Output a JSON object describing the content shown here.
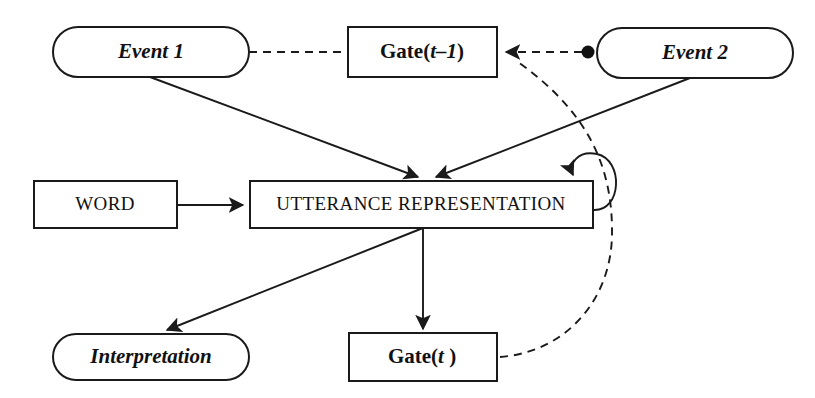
{
  "diagram": {
    "background_color": "#ffffff",
    "stroke_color": "#1a1a1a",
    "nodes": [
      {
        "id": "event1",
        "data_name": "node-event-1",
        "label": "Event 1",
        "shape": "rounded-rect",
        "style": "bold-italic",
        "x": 53,
        "y": 27,
        "w": 196,
        "h": 50
      },
      {
        "id": "gate_t_minus_1",
        "data_name": "node-gate-t-minus-1",
        "label": "Gate(t–1)",
        "label_bold_part": "Gate(",
        "label_italic_part": "t–1",
        "label_tail": ")",
        "shape": "rect",
        "style": "bold",
        "x": 348,
        "y": 27,
        "w": 149,
        "h": 50
      },
      {
        "id": "event2",
        "data_name": "node-event-2",
        "label": "Event 2",
        "shape": "rounded-rect",
        "style": "bold-italic",
        "x": 597,
        "y": 28,
        "w": 196,
        "h": 50
      },
      {
        "id": "word",
        "data_name": "node-word",
        "label": "WORD",
        "shape": "rect",
        "style": "plain-caps",
        "x": 34,
        "y": 181,
        "w": 143,
        "h": 47
      },
      {
        "id": "utterance",
        "data_name": "node-utterance-representation",
        "label": "UTTERANCE REPRESENTATION",
        "shape": "rect",
        "style": "plain-caps",
        "x": 250,
        "y": 181,
        "w": 343,
        "h": 47
      },
      {
        "id": "interpretation",
        "data_name": "node-interpretation",
        "label": "Interpretation",
        "shape": "rounded-rect",
        "style": "bold-italic",
        "x": 53,
        "y": 334,
        "w": 196,
        "h": 46
      },
      {
        "id": "gate_t",
        "data_name": "node-gate-t",
        "label": "Gate(t )",
        "label_bold_part": "Gate(",
        "label_italic_part": "t",
        "label_tail": " )",
        "shape": "rect",
        "style": "bold",
        "x": 349,
        "y": 333,
        "w": 148,
        "h": 48
      }
    ],
    "edges": [
      {
        "id": "e1",
        "data_name": "edge-event1-to-gate-t-minus-1",
        "from": "event1",
        "to": "gate_t_minus_1",
        "line": "dashed",
        "arrowhead": false
      },
      {
        "id": "e2",
        "data_name": "edge-event1-to-utterance",
        "from": "event1",
        "to": "utterance",
        "line": "solid",
        "arrowhead": true
      },
      {
        "id": "e3",
        "data_name": "edge-event2-to-gate-t-minus-1",
        "from": "event2",
        "to": "gate_t_minus_1",
        "line": "dashed",
        "arrowhead": true
      },
      {
        "id": "e4",
        "data_name": "edge-event2-to-utterance",
        "from": "event2",
        "to": "utterance",
        "line": "solid",
        "arrowhead": true
      },
      {
        "id": "e5",
        "data_name": "edge-word-to-utterance",
        "from": "word",
        "to": "utterance",
        "line": "solid",
        "arrowhead": true
      },
      {
        "id": "e6",
        "data_name": "edge-utterance-self-loop",
        "from": "utterance",
        "to": "utterance",
        "line": "solid",
        "arrowhead": true
      },
      {
        "id": "e7",
        "data_name": "edge-utterance-to-interpretation",
        "from": "utterance",
        "to": "interpretation",
        "line": "solid",
        "arrowhead": true
      },
      {
        "id": "e8",
        "data_name": "edge-utterance-to-gate-t",
        "from": "utterance",
        "to": "gate_t",
        "line": "solid",
        "arrowhead": true
      },
      {
        "id": "e9",
        "data_name": "edge-gate-t-feedback-to-gate-t-minus-1",
        "from": "gate_t",
        "to": "gate_t_minus_1",
        "line": "dashed",
        "arrowhead": true
      }
    ],
    "junction_dot": {
      "data_name": "junction-dot-event2",
      "x": 588,
      "y": 52,
      "r": 6.5
    }
  }
}
